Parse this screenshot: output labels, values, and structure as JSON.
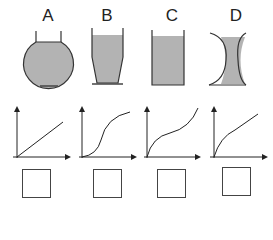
{
  "vessels": [
    {
      "label": "A",
      "shape": "round-flask"
    },
    {
      "label": "B",
      "shape": "tapered-narrowing-downward"
    },
    {
      "label": "C",
      "shape": "straight-cylinder"
    },
    {
      "label": "D",
      "shape": "hourglass-concave"
    }
  ],
  "graphs": [
    {
      "curve": "linear"
    },
    {
      "curve": "s-curve"
    },
    {
      "curve": "concave-then-convex"
    },
    {
      "curve": "concave-down"
    }
  ],
  "answer_boxes": [
    "",
    "",
    "",
    ""
  ],
  "colors": {
    "fill": "#b3b3b3",
    "stroke": "#333333"
  }
}
